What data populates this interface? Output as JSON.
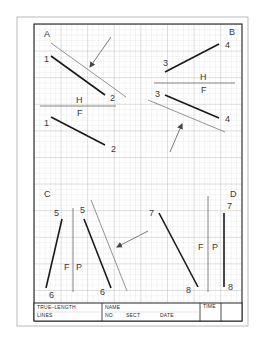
{
  "sheet": {
    "colors": {
      "paper": "#ffffff",
      "outer_border": "#9a9a9a",
      "inner_border": "#222222",
      "grid_minor": "#d6d6d6",
      "grid_major": "#b9b9b9",
      "thick_line": "#1a1a1a",
      "thin_line": "#666666",
      "label": "#3a3a3a"
    }
  },
  "quadrants": {
    "A": {
      "name": "A",
      "upper": {
        "start_label": "1",
        "end_label": "2"
      },
      "fold": {
        "top_label": "H",
        "bottom_label": "F"
      },
      "lower": {
        "start_label": "1",
        "end_label": "2"
      }
    },
    "B": {
      "name": "B",
      "upper": {
        "start_label": "3",
        "end_label": "4"
      },
      "fold": {
        "top_label": "H",
        "bottom_label": "F"
      },
      "lower": {
        "start_label": "3",
        "end_label": "4"
      }
    },
    "C": {
      "name": "C",
      "left": {
        "start_label": "5",
        "end_label": "6"
      },
      "fold": {
        "left_label": "F",
        "right_label": "P"
      },
      "right": {
        "start_label": "5",
        "end_label": "6"
      }
    },
    "D": {
      "name": "D",
      "left": {
        "start_label": "7",
        "end_label": "8"
      },
      "fold": {
        "left_label": "F",
        "right_label": "P"
      },
      "right": {
        "start_label": "7",
        "end_label": "8"
      }
    }
  },
  "title_block": {
    "title_line1": "TRUE–LENGTH",
    "title_line2": "LINES",
    "name_label": "NAME",
    "no_label": "NO.",
    "sect_label": "SECT",
    "date_label": "DATE",
    "time_label": "TIME"
  }
}
